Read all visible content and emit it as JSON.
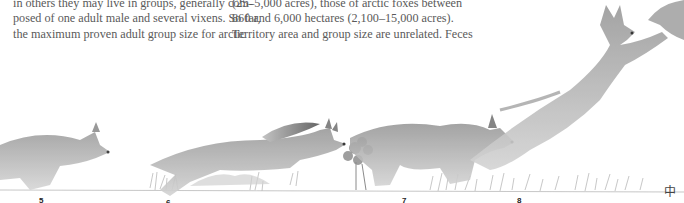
{
  "text": {
    "column1": [
      "in others they may live in groups, generally com-",
      "posed of one adult male and several vixens. So far,",
      "the maximum proven adult group size for arctic"
    ],
    "column2": [
      "(25–5,000 acres), those of arctic foxes between",
      "860 and 6,000 hectares (2,100–15,000 acres).",
      "Territory area and group size are unrelated. Feces"
    ]
  },
  "illustration": {
    "subject": "sequence of running and leaping foxes (pencil drawing)",
    "figure_numbers": [
      "5",
      "6",
      "7",
      "8"
    ],
    "signature": "中"
  }
}
